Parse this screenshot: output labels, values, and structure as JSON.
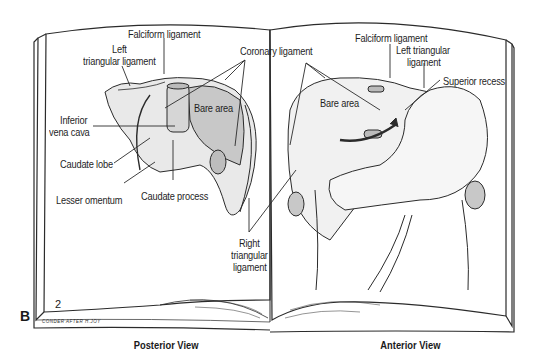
{
  "figure": {
    "letter": "B",
    "page_number": "2",
    "credit": "CONDER AFTER H.JOY",
    "colors": {
      "line": "#2b2b2b",
      "organ_fill": "#e9e9e9",
      "shade_fill": "#c8c8c8",
      "paper": "#ffffff"
    }
  },
  "posterior_view": {
    "caption": "Posterior View",
    "labels": {
      "falciform": "Falciform ligament",
      "left_triangular_1": "Left",
      "left_triangular_2": "triangular ligament",
      "coronary": "Coronary ligament",
      "bare_area": "Bare area",
      "ivc_1": "Inferior",
      "ivc_2": "vena cava",
      "caudate_lobe": "Caudate lobe",
      "lesser_omentum": "Lesser omentum",
      "caudate_process": "Caudate process",
      "right_triangular_1": "Right",
      "right_triangular_2": "triangular",
      "right_triangular_3": "ligament"
    }
  },
  "anterior_view": {
    "caption": "Anterior View",
    "labels": {
      "falciform": "Falciform ligament",
      "left_triangular_1": "Left triangular",
      "left_triangular_2": "ligament",
      "superior_recess": "Superior recess",
      "bare_area": "Bare area"
    }
  }
}
